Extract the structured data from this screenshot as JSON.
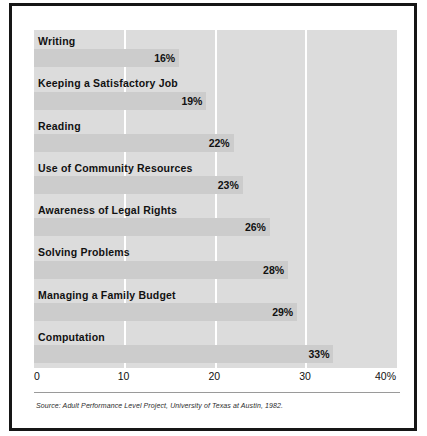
{
  "chart_data": {
    "type": "bar",
    "orientation": "horizontal",
    "title": "",
    "xlabel": "",
    "ylabel": "",
    "xlim": [
      0,
      40
    ],
    "grid": true,
    "legend": "none",
    "categories": [
      "Writing",
      "Keeping a Satisfactory Job",
      "Reading",
      "Use of Community Resources",
      "Awareness of Legal Rights",
      "Solving Problems",
      "Managing a Family Budget",
      "Computation"
    ],
    "values": [
      16,
      19,
      22,
      23,
      26,
      28,
      29,
      33
    ],
    "value_labels": [
      "16%",
      "19%",
      "22%",
      "23%",
      "26%",
      "28%",
      "29%",
      "33%"
    ],
    "tick_values": [
      0,
      10,
      20,
      30,
      40
    ],
    "tick_labels": [
      "0",
      "10",
      "20",
      "30",
      "40%"
    ],
    "gridline_values": [
      10,
      20,
      30
    ],
    "colors": {
      "plot_background": "#dcdcdc",
      "bar_fill": "#cccccc",
      "gridline": "#ffffff",
      "text": "#111111",
      "frame_border": "#161616",
      "footer_rule": "#9a9a9a"
    }
  },
  "footer": {
    "source": "Source: Adult Performance Level Project, University of Texas at Austin, 1982."
  }
}
